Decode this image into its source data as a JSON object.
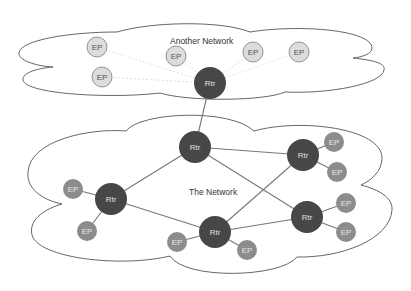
{
  "colors": {
    "router_fill": "#474747",
    "router_text": "#e0e0e0",
    "ep_fill_main": "#8c8c8c",
    "ep_text_main": "#e6e6e6",
    "ep_fill_other": "#dcdcdc",
    "ep_stroke_other": "#8a8a8a",
    "ep_text_other": "#555555",
    "cloud_stroke": "#555555"
  },
  "clouds": [
    {
      "id": "another-network",
      "label": "Another Network",
      "label_pos": [
        170,
        44
      ]
    },
    {
      "id": "the-network",
      "label": "The Network",
      "label_pos": [
        189,
        195
      ]
    }
  ],
  "routers": [
    {
      "id": "r-gw",
      "label": "Rtr",
      "x": 210,
      "y": 83,
      "r": 16
    },
    {
      "id": "r-top",
      "label": "Rtr",
      "x": 195,
      "y": 147,
      "r": 16
    },
    {
      "id": "r-left",
      "label": "Rtr",
      "x": 111,
      "y": 199,
      "r": 16
    },
    {
      "id": "r-bottom",
      "label": "Rtr",
      "x": 215,
      "y": 232,
      "r": 16
    },
    {
      "id": "r-right-top",
      "label": "Rtr",
      "x": 303,
      "y": 155,
      "r": 16
    },
    {
      "id": "r-right-bottom",
      "label": "Rtr",
      "x": 307,
      "y": 217,
      "r": 16
    }
  ],
  "endpoints": [
    {
      "id": "ep-o1",
      "label": "EP",
      "x": 97,
      "y": 47,
      "r": 10,
      "network": "another-network"
    },
    {
      "id": "ep-o2",
      "label": "EP",
      "x": 176,
      "y": 56,
      "r": 10,
      "network": "another-network"
    },
    {
      "id": "ep-o3",
      "label": "EP",
      "x": 102,
      "y": 77,
      "r": 10,
      "network": "another-network"
    },
    {
      "id": "ep-o4",
      "label": "EP",
      "x": 253,
      "y": 52,
      "r": 10,
      "network": "another-network"
    },
    {
      "id": "ep-o5",
      "label": "EP",
      "x": 299,
      "y": 52,
      "r": 10,
      "network": "another-network"
    },
    {
      "id": "ep-m1",
      "label": "EP",
      "x": 73,
      "y": 189,
      "r": 10,
      "network": "the-network"
    },
    {
      "id": "ep-m2",
      "label": "EP",
      "x": 87,
      "y": 231,
      "r": 10,
      "network": "the-network"
    },
    {
      "id": "ep-m3",
      "label": "EP",
      "x": 177,
      "y": 242,
      "r": 10,
      "network": "the-network"
    },
    {
      "id": "ep-m4",
      "label": "EP",
      "x": 247,
      "y": 250,
      "r": 10,
      "network": "the-network"
    },
    {
      "id": "ep-m5",
      "label": "EP",
      "x": 334,
      "y": 142,
      "r": 10,
      "network": "the-network"
    },
    {
      "id": "ep-m6",
      "label": "EP",
      "x": 337,
      "y": 172,
      "r": 10,
      "network": "the-network"
    },
    {
      "id": "ep-m7",
      "label": "EP",
      "x": 346,
      "y": 203,
      "r": 10,
      "network": "the-network"
    },
    {
      "id": "ep-m8",
      "label": "EP",
      "x": 346,
      "y": 232,
      "r": 10,
      "network": "the-network"
    }
  ],
  "edges": [
    {
      "from": "ep-o1",
      "to": "r-gw",
      "style": "faint"
    },
    {
      "from": "ep-o2",
      "to": "r-gw",
      "style": "faint"
    },
    {
      "from": "ep-o3",
      "to": "r-gw",
      "style": "faint"
    },
    {
      "from": "ep-o4",
      "to": "r-gw",
      "style": "faint"
    },
    {
      "from": "ep-o5",
      "to": "r-gw",
      "style": "faint"
    },
    {
      "from": "r-gw",
      "to": "r-top",
      "style": "solid"
    },
    {
      "from": "r-top",
      "to": "r-left",
      "style": "solid"
    },
    {
      "from": "r-top",
      "to": "r-right-top",
      "style": "solid"
    },
    {
      "from": "r-top",
      "to": "r-right-bottom",
      "style": "solid"
    },
    {
      "from": "r-left",
      "to": "r-bottom",
      "style": "solid"
    },
    {
      "from": "r-bottom",
      "to": "r-right-top",
      "style": "solid"
    },
    {
      "from": "r-bottom",
      "to": "r-right-bottom",
      "style": "solid"
    },
    {
      "from": "ep-m1",
      "to": "r-left",
      "style": "solid"
    },
    {
      "from": "ep-m2",
      "to": "r-left",
      "style": "solid"
    },
    {
      "from": "ep-m3",
      "to": "r-bottom",
      "style": "solid"
    },
    {
      "from": "ep-m4",
      "to": "r-bottom",
      "style": "solid"
    },
    {
      "from": "ep-m5",
      "to": "r-right-top",
      "style": "solid"
    },
    {
      "from": "ep-m6",
      "to": "r-right-top",
      "style": "solid"
    },
    {
      "from": "ep-m7",
      "to": "r-right-bottom",
      "style": "solid"
    },
    {
      "from": "ep-m8",
      "to": "r-right-bottom",
      "style": "solid"
    }
  ]
}
